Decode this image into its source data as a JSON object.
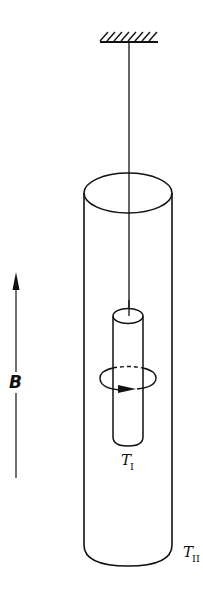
{
  "diagram": {
    "labels": {
      "field": "B",
      "inner_cylinder_main": "T",
      "inner_cylinder_sub": "I",
      "outer_cylinder_main": "T",
      "outer_cylinder_sub": "II"
    },
    "colors": {
      "stroke": "#111111",
      "background": "#ffffff"
    },
    "elements": {
      "ceiling_support": "hatched fixed support",
      "wire": "suspension wire",
      "outer_cylinder": "T_II",
      "inner_cylinder": "T_I",
      "rotation_loop": "circular arrow indicating rotation",
      "field_arrow": "upward arrow B"
    }
  }
}
